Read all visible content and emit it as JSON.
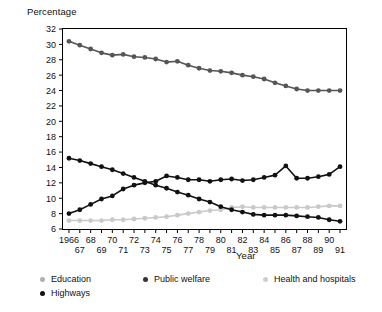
{
  "chart_data": {
    "type": "line",
    "title": "",
    "ylabel": "Percentage",
    "xlabel": "Year",
    "ylim": [
      6,
      32
    ],
    "ytick_step": 2,
    "yticks": [
      6,
      8,
      10,
      12,
      14,
      16,
      18,
      20,
      22,
      24,
      26,
      28,
      30,
      32
    ],
    "grid": false,
    "legend_position": "bottom-left",
    "x": [
      1966,
      1967,
      1968,
      1969,
      1970,
      1971,
      1972,
      1973,
      1974,
      1975,
      1976,
      1977,
      1978,
      1979,
      1980,
      1981,
      1982,
      1983,
      1984,
      1985,
      1986,
      1987,
      1988,
      1989,
      1990,
      1991
    ],
    "xtick_labels_top": [
      "1966",
      "",
      "68",
      "",
      "70",
      "",
      "72",
      "",
      "74",
      "",
      "76",
      "",
      "78",
      "",
      "80",
      "",
      "82",
      "",
      "84",
      "",
      "86",
      "",
      "88",
      "",
      "90",
      ""
    ],
    "xtick_labels_bottom": [
      "",
      "67",
      "",
      "69",
      "",
      "71",
      "",
      "73",
      "",
      "75",
      "",
      "77",
      "",
      "79",
      "",
      "81",
      "",
      "83",
      "",
      "85",
      "",
      "87",
      "",
      "89",
      "",
      "91"
    ],
    "series": [
      {
        "name": "Education",
        "color": "#555555",
        "values": [
          30.4,
          29.9,
          29.4,
          28.9,
          28.6,
          28.7,
          28.4,
          28.3,
          28.1,
          27.7,
          27.8,
          27.3,
          26.9,
          26.6,
          26.5,
          26.3,
          26.0,
          25.8,
          25.5,
          25.0,
          24.6,
          24.2,
          24.0,
          24.0,
          24.0,
          24.0
        ]
      },
      {
        "name": "Public welfare",
        "color": "#111111",
        "values": [
          8.0,
          8.5,
          9.2,
          9.9,
          10.3,
          11.2,
          11.7,
          12.0,
          12.2,
          12.9,
          12.7,
          12.4,
          12.4,
          12.2,
          12.4,
          12.5,
          12.3,
          12.4,
          12.7,
          13.0,
          14.2,
          12.6,
          12.6,
          12.8,
          13.1,
          14.1
        ]
      },
      {
        "name": "Health and hospitals",
        "color": "#c9c9c9",
        "values": [
          7.1,
          7.1,
          7.1,
          7.1,
          7.2,
          7.2,
          7.3,
          7.4,
          7.5,
          7.6,
          7.8,
          8.0,
          8.2,
          8.4,
          8.5,
          8.8,
          8.9,
          8.8,
          8.8,
          8.8,
          8.8,
          8.8,
          8.8,
          8.9,
          9.0,
          9.0
        ]
      },
      {
        "name": "Highways",
        "color": "#111111",
        "values": [
          15.2,
          14.9,
          14.5,
          14.1,
          13.7,
          13.2,
          12.7,
          12.2,
          11.7,
          11.3,
          10.8,
          10.4,
          9.9,
          9.5,
          8.9,
          8.5,
          8.2,
          7.9,
          7.8,
          7.8,
          7.8,
          7.7,
          7.6,
          7.5,
          7.2,
          7.0
        ]
      }
    ]
  },
  "legend": {
    "items": [
      {
        "label": "Education",
        "color": "#b0b0b0"
      },
      {
        "label": "Public welfare",
        "color": "#333333"
      },
      {
        "label": "Health and hospitals",
        "color": "#cfcfcf"
      },
      {
        "label": "Highways",
        "color": "#111111"
      }
    ]
  }
}
